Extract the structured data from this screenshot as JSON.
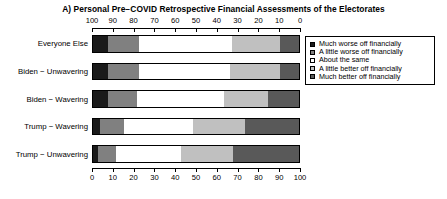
{
  "chart_data": {
    "type": "bar",
    "orientation": "horizontal",
    "stacked": true,
    "stack_percent": true,
    "title": "A) Personal Pre−COVID Retrospective Financial Assessments of the Electorates",
    "xlabel": "",
    "ylabel": "",
    "xlim": [
      0,
      100
    ],
    "grid": false,
    "legend_position": "right",
    "top_axis": {
      "reversed": true,
      "ticks": [
        100,
        90,
        80,
        70,
        60,
        50,
        40,
        30,
        20,
        10,
        0
      ],
      "tick_labels": [
        "100",
        "90",
        "80",
        "70",
        "60",
        "50",
        "40",
        "30",
        "20",
        "10",
        "0"
      ]
    },
    "bottom_axis": {
      "reversed": false,
      "ticks": [
        0,
        10,
        20,
        30,
        40,
        50,
        60,
        70,
        80,
        90,
        100
      ],
      "tick_labels": [
        "0",
        "10",
        "20",
        "30",
        "40",
        "50",
        "60",
        "70",
        "80",
        "90",
        "100"
      ]
    },
    "categories": [
      "Everyone Else",
      "Biden − Unwavering",
      "Biden − Wavering",
      "Trump − Wavering",
      "Trump − Unwavering"
    ],
    "series": [
      {
        "name": "Much worse off financially",
        "color": "#1a1a1a",
        "values": [
          7,
          7,
          7,
          3.5,
          2.5
        ]
      },
      {
        "name": "A little worse off financially",
        "color": "#808080",
        "values": [
          15,
          15,
          14,
          11.5,
          8.5
        ]
      },
      {
        "name": "About the same",
        "color": "#ffffff",
        "values": [
          45,
          44,
          42,
          33,
          31.5
        ]
      },
      {
        "name": "A little better off financially",
        "color": "#c0c0c0",
        "values": [
          23,
          24,
          21,
          25,
          25
        ]
      },
      {
        "name": "Much better off financially",
        "color": "#595959",
        "values": [
          10,
          10,
          16,
          27,
          32.5
        ]
      }
    ]
  },
  "legend": {
    "items": [
      {
        "label": "Much worse off financially",
        "color": "#1a1a1a"
      },
      {
        "label": "A little worse off financially",
        "color": "#808080"
      },
      {
        "label": "About the same",
        "color": "#ffffff"
      },
      {
        "label": "A little better off financially",
        "color": "#c0c0c0"
      },
      {
        "label": "Much better off financially",
        "color": "#595959"
      }
    ]
  }
}
